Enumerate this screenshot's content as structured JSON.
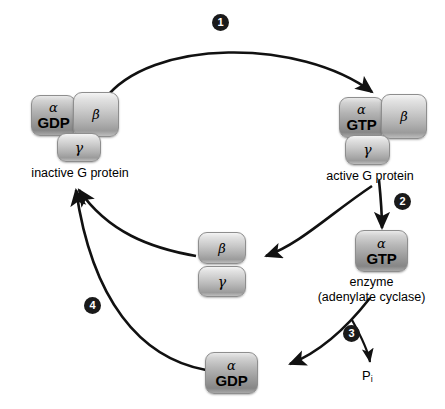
{
  "diagram": {
    "type": "cycle-diagram",
    "accent_color": "#1a1a1a",
    "subunit_fill": "#c9c9c9"
  },
  "complexes": {
    "inactive": {
      "caption": "inactive G protein",
      "alpha_greek": "α",
      "alpha_nucleotide": "GDP",
      "beta_greek": "β",
      "gamma_greek": "γ"
    },
    "active": {
      "caption": "active G protein",
      "alpha_greek": "α",
      "alpha_nucleotide": "GTP",
      "beta_greek": "β",
      "gamma_greek": "γ"
    },
    "beta_gamma_dimer": {
      "beta_greek": "β",
      "gamma_greek": "γ"
    },
    "alpha_gtp": {
      "greek": "α",
      "nucleotide": "GTP",
      "caption_line1": "enzyme",
      "caption_line2": "(adenylate cyclase)"
    },
    "alpha_gdp": {
      "greek": "α",
      "nucleotide": "GDP"
    }
  },
  "steps": [
    {
      "number": "1"
    },
    {
      "number": "2"
    },
    {
      "number": "3"
    },
    {
      "number": "4"
    }
  ],
  "byproduct": {
    "symbol": "P",
    "subscript": "i"
  }
}
